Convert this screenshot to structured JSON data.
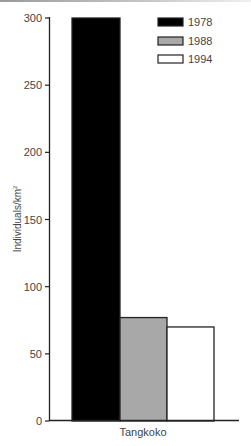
{
  "chart_data": {
    "type": "bar",
    "title": "",
    "xlabel": "",
    "ylabel": "Individuals/km²",
    "ylabel_main": "Individuals/km",
    "ylabel_sup": "2",
    "ylim": [
      0,
      300
    ],
    "yticks": [
      0,
      50,
      100,
      150,
      200,
      250,
      300
    ],
    "ytick_labels": [
      "0",
      "50",
      "100",
      "150",
      "200",
      "250",
      "300"
    ],
    "categories": [
      "Tangkoko"
    ],
    "series": [
      {
        "name": "1978",
        "values": [
          300
        ],
        "color": "#000000"
      },
      {
        "name": "1988",
        "values": [
          77
        ],
        "color": "#a8a8a8"
      },
      {
        "name": "1994",
        "values": [
          70
        ],
        "color": "#ffffff"
      }
    ],
    "legend": {
      "position": "upper-right",
      "entries": [
        "1978",
        "1988",
        "1994"
      ]
    },
    "grid": false
  }
}
